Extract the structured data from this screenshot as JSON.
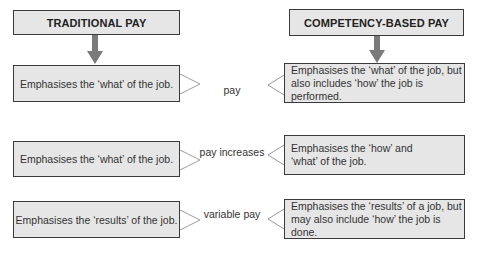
{
  "headers": {
    "left": "TRADITIONAL PAY",
    "right": "COMPETENCY-BASED PAY"
  },
  "rows": [
    {
      "label": "pay",
      "traditional": "Emphasises the ‘what’ of the job.",
      "competency": "Emphasises the ‘what’ of the job, but also includes ‘how’ the job is performed."
    },
    {
      "label": "pay increases",
      "traditional": "Emphasises the ‘what’ of the job.",
      "competency": "Emphasises the ‘how’ and ‘what’ of the job."
    },
    {
      "label": "variable pay",
      "traditional": "Emphasises the ‘results’ of the job.",
      "competency": "Emphasises the ‘results’ of a job, but may also include ‘how’ the job is done."
    }
  ],
  "colors": {
    "box_fill": "#e6e6e6",
    "border": "#3a3a3a",
    "arrow": "#7a7a7a",
    "chevron": "#9a9a9a"
  }
}
